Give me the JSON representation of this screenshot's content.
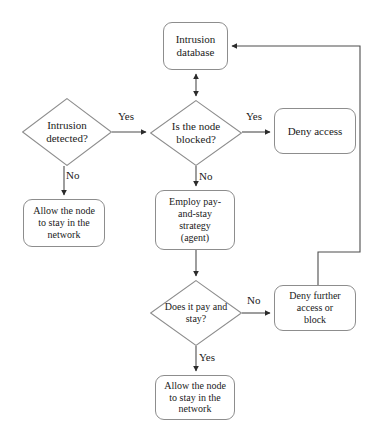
{
  "diagram": {
    "background_color": "#ffffff",
    "line_color": "#4d4d4d",
    "shape_border_color": "#8d8d8d",
    "text_color": "#1a1a1a",
    "nodes": [
      {
        "id": "intrusion-database",
        "shape": "rounded-rect",
        "label": "Intrusion\ndatabase",
        "x": 163,
        "y": 22,
        "w": 65,
        "h": 48,
        "font_size": 11
      },
      {
        "id": "intrusion-detected",
        "shape": "diamond",
        "label": "Intrusion\ndetected?",
        "x": 22,
        "y": 98,
        "w": 90,
        "h": 68,
        "font_size": 11
      },
      {
        "id": "is-node-blocked",
        "shape": "diamond",
        "label": "Is the node\nblocked?",
        "x": 150,
        "y": 100,
        "w": 92,
        "h": 66,
        "font_size": 11
      },
      {
        "id": "deny-access",
        "shape": "rounded-rect",
        "label": "Deny access",
        "x": 274,
        "y": 108,
        "w": 82,
        "h": 46,
        "font_size": 11
      },
      {
        "id": "allow-node-top",
        "shape": "rounded-rect",
        "label": "Allow the node\nto stay in the\nnetwork",
        "x": 23,
        "y": 199,
        "w": 82,
        "h": 48,
        "font_size": 10
      },
      {
        "id": "employ-pay-and-stay",
        "shape": "rounded-rect",
        "label": "Employ pay-\nand-stay\nstrategy\n(agent)",
        "x": 155,
        "y": 190,
        "w": 80,
        "h": 60,
        "font_size": 10
      },
      {
        "id": "does-it-pay-and-stay",
        "shape": "diamond",
        "label": "Does it pay and\nstay?",
        "x": 150,
        "y": 280,
        "w": 92,
        "h": 66,
        "font_size": 10
      },
      {
        "id": "deny-further-access",
        "shape": "rounded-rect",
        "label": "Deny further\naccess or\nblock",
        "x": 274,
        "y": 285,
        "w": 82,
        "h": 46,
        "font_size": 10
      },
      {
        "id": "allow-node-bottom",
        "shape": "rounded-rect",
        "label": "Allow the node\nto stay in the\nnetwork",
        "x": 155,
        "y": 375,
        "w": 80,
        "h": 45,
        "font_size": 10
      }
    ],
    "edges": [
      {
        "id": "detected-to-blocked",
        "from": "intrusion-detected",
        "to": "is-node-blocked",
        "label": "Yes"
      },
      {
        "id": "detected-to-allow",
        "from": "intrusion-detected",
        "to": "allow-node-top",
        "label": "No"
      },
      {
        "id": "blocked-to-deny",
        "from": "is-node-blocked",
        "to": "deny-access",
        "label": "Yes"
      },
      {
        "id": "blocked-to-employ",
        "from": "is-node-blocked",
        "to": "employ-pay-and-stay",
        "label": "No"
      },
      {
        "id": "database-blocked-link",
        "from": "intrusion-database",
        "to": "is-node-blocked",
        "label": ""
      },
      {
        "id": "employ-to-pay-decision",
        "from": "employ-pay-and-stay",
        "to": "does-it-pay-and-stay",
        "label": ""
      },
      {
        "id": "pay-to-deny-further",
        "from": "does-it-pay-and-stay",
        "to": "deny-further-access",
        "label": "No"
      },
      {
        "id": "pay-to-allow",
        "from": "does-it-pay-and-stay",
        "to": "allow-node-bottom",
        "label": "Yes"
      },
      {
        "id": "deny-further-to-database",
        "from": "deny-further-access",
        "to": "intrusion-database",
        "label": ""
      }
    ],
    "edge_labels": [
      {
        "id": "label-yes-detected-blocked",
        "text": "Yes",
        "x": 118,
        "y": 111
      },
      {
        "id": "label-no-detected-allow",
        "text": "No",
        "x": 62,
        "y": 170
      },
      {
        "id": "label-yes-blocked-deny",
        "text": "Yes",
        "x": 246,
        "y": 111
      },
      {
        "id": "label-no-blocked-employ",
        "text": "No",
        "x": 199,
        "y": 173
      },
      {
        "id": "label-no-pay-deny",
        "text": "No",
        "x": 247,
        "y": 291
      },
      {
        "id": "label-yes-pay-allow",
        "text": "Yes",
        "x": 199,
        "y": 355
      }
    ]
  }
}
